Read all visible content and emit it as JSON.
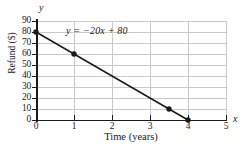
{
  "chart_data": {
    "type": "line",
    "title": "",
    "subtitle": "",
    "xlabel": "Time (years)",
    "ylabel": "Refund ($)",
    "x_variable": "x",
    "y_variable": "y",
    "annotation": "y = −20x + 80",
    "equation_plain": "y = -20x + 80",
    "slope": -20,
    "intercept": 80,
    "xlim": [
      0,
      5
    ],
    "ylim": [
      0,
      90
    ],
    "xticks": [
      0,
      1,
      2,
      3,
      4,
      5
    ],
    "xtick_labels": [
      "0",
      "1",
      "2",
      "3",
      "4",
      "5"
    ],
    "yticks": [
      0,
      10,
      20,
      30,
      40,
      50,
      60,
      70,
      80,
      90
    ],
    "ytick_labels": [
      "0",
      "10",
      "20",
      "30",
      "40",
      "50",
      "60",
      "70",
      "80",
      "90"
    ],
    "grid": true,
    "grid_color": "#c9c9c9",
    "legend": null,
    "line_color": "#1a1a1a",
    "marker_color": "#1a1a1a",
    "line_endpoints": {
      "x": [
        0,
        4
      ],
      "y": [
        80,
        0
      ]
    },
    "markers": [
      {
        "x": 0,
        "y": 80
      },
      {
        "x": 1,
        "y": 60
      },
      {
        "x": 3.5,
        "y": 10
      },
      {
        "x": 4,
        "y": 0
      }
    ],
    "series": [
      {
        "name": "Refund",
        "x": [
          0,
          1,
          3.5,
          4
        ],
        "y": [
          80,
          60,
          10,
          0
        ]
      }
    ]
  }
}
